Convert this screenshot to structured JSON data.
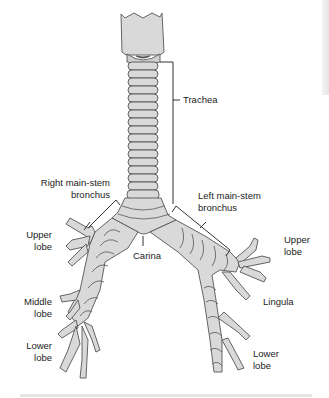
{
  "figure": {
    "labels": {
      "trachea": "Trachea",
      "right_main_stem": "Right main-stem\nbronchus",
      "left_main_stem": "Left main-stem\nbronchus",
      "carina": "Carina",
      "right_upper_lobe": "Upper\nlobe",
      "right_middle_lobe": "Middle\nlobe",
      "right_lower_lobe": "Lower\nlobe",
      "left_upper_lobe": "Upper\nlobe",
      "lingula": "Lingula",
      "left_lower_lobe": "Lower\nlobe"
    },
    "colors": {
      "fill": "#d9d9d9",
      "outline": "#555555",
      "leader_line": "#333333",
      "background": "#ffffff"
    }
  }
}
